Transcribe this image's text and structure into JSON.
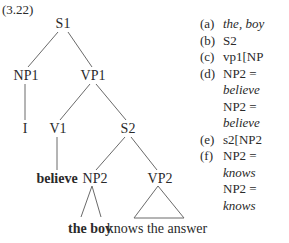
{
  "example_number": "(3.22)",
  "tree": {
    "nodes": {
      "s1": "S1",
      "np1": "NP1",
      "vp1": "VP1",
      "i": "I",
      "v1": "V1",
      "s2": "S2",
      "believe": "believe",
      "np2": "NP2",
      "vp2": "VP2",
      "the_boy": "the boy",
      "knows_the_answer": "knows the answer"
    }
  },
  "list": {
    "items": [
      {
        "label": "(a)",
        "lines": [
          {
            "text": "the, boy",
            "italic": true
          }
        ]
      },
      {
        "label": "(b)",
        "lines": [
          {
            "text": "S2",
            "italic": false
          }
        ]
      },
      {
        "label": "(c)",
        "lines": [
          {
            "text": "vp1[NP",
            "italic": false
          }
        ]
      },
      {
        "label": "(d)",
        "lines": [
          {
            "text": "NP2 =",
            "italic": false
          },
          {
            "text": "believe",
            "italic": true
          },
          {
            "text": "NP2 =",
            "italic": false
          },
          {
            "text": "believe",
            "italic": true
          }
        ]
      },
      {
        "label": "(e)",
        "lines": [
          {
            "text": "s2[NP2",
            "italic": false
          }
        ]
      },
      {
        "label": "(f)",
        "lines": [
          {
            "text": "NP2 =",
            "italic": false
          },
          {
            "text": "knows",
            "italic": true
          },
          {
            "text": "NP2 =",
            "italic": false
          },
          {
            "text": "knows",
            "italic": true
          }
        ]
      }
    ]
  },
  "colors": {
    "text": "#2a2a2a",
    "lines": "#6a6a6a",
    "background": "#ffffff"
  }
}
